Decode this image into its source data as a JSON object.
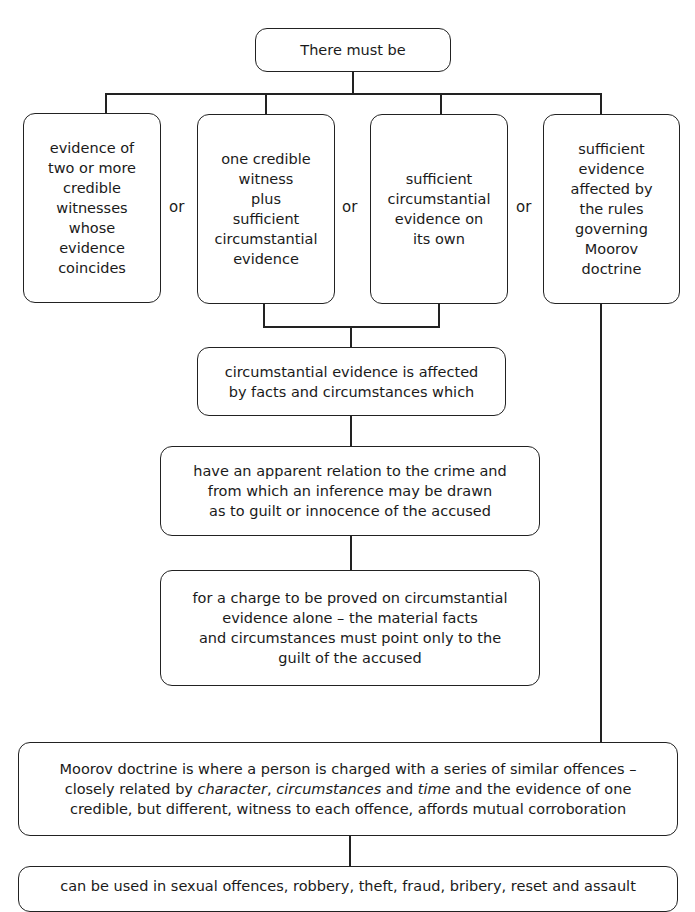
{
  "diagram": {
    "root": {
      "label": "There must be"
    },
    "options": [
      {
        "label": "evidence of\ntwo or more\ncredible\nwitnesses\nwhose\nevidence\ncoincides"
      },
      {
        "label": "one credible\nwitness\nplus\nsufficient\ncircumstantial\nevidence"
      },
      {
        "label": "sufficient\ncircumstantial\nevidence on\nits own"
      },
      {
        "label": "sufficient\nevidence\naffected by\nthe rules\ngoverning\nMoorov\ndoctrine"
      }
    ],
    "separator": "or",
    "circumstantial": {
      "step1": "circumstantial evidence is affected\nby facts and circumstances which",
      "step2": "have an apparent relation to the crime and\nfrom which an inference may be drawn\nas to guilt or innocence of the accused",
      "step3": "for a charge to be proved on circumstantial\nevidence alone – the material facts\nand circumstances must point only to the\nguilt of the accused"
    },
    "moorov": {
      "line1": "Moorov doctrine is where a person is charged with a series of similar offences –",
      "line2_pre": "closely related by ",
      "line2_em1": "character",
      "line2_mid1": ", ",
      "line2_em2": "circumstances",
      "line2_mid2": " and ",
      "line2_em3": "time",
      "line2_post": " and the evidence of one",
      "line3": "credible, but different, witness to each offence, affords mutual corroboration"
    },
    "usage": {
      "label": "can be used in sexual offences, robbery, theft, fraud, bribery, reset and assault"
    }
  }
}
